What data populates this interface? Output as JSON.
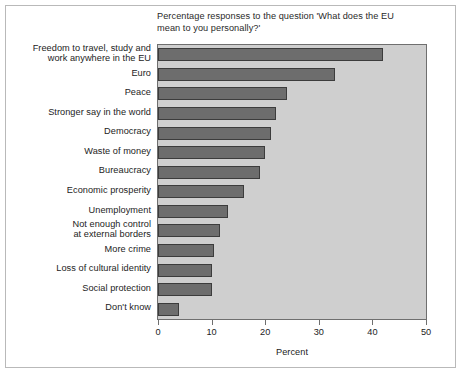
{
  "figure": {
    "title": "Percentage responses to the question 'What does the EU\nmean to you personally?'",
    "panel_color": "#cfcfcf",
    "bar_color": "#6d6d6d",
    "bar_edge_color": "#3c3c3c",
    "frame_color": "#b9b9b9"
  },
  "chart_data": {
    "type": "bar",
    "orientation": "horizontal",
    "title": "Percentage responses to the question 'What does the EU mean to you personally?'",
    "xlabel": "Percent",
    "ylabel": "",
    "xlim": [
      0,
      50
    ],
    "xticks": [
      0,
      10,
      20,
      30,
      40,
      50
    ],
    "xtick_labels": [
      "0",
      "10",
      "20",
      "30",
      "40",
      "50"
    ],
    "grid": false,
    "legend": null,
    "categories": [
      "Freedom to travel, study and\nwork anywhere in the EU",
      "Euro",
      "Peace",
      "Stronger say in the world",
      "Democracy",
      "Waste of money",
      "Bureaucracy",
      "Economic prosperity",
      "Unemployment",
      "Not enough control\nat external borders",
      "More crime",
      "Loss of cultural identity",
      "Social protection",
      "Don't know"
    ],
    "values": [
      42,
      33,
      24,
      22,
      21,
      20,
      19,
      16,
      13,
      11.5,
      10.5,
      10,
      10,
      4
    ]
  },
  "axis": {
    "x_title": "Percent"
  }
}
